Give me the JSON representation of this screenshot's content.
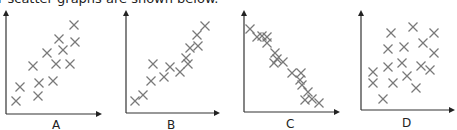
{
  "caption": "r scatter graphs are shown below.",
  "chart_data": [
    {
      "type": "scatter",
      "label": "A",
      "description": "moderate positive correlation",
      "axes": {
        "origin": [
          6,
          114
        ],
        "x_end": 102,
        "y_end": 10
      },
      "points": [
        [
          74,
          25
        ],
        [
          59,
          39
        ],
        [
          75,
          42
        ],
        [
          63,
          50
        ],
        [
          47,
          53
        ],
        [
          33,
          66
        ],
        [
          56,
          64
        ],
        [
          70,
          64
        ],
        [
          20,
          87
        ],
        [
          39,
          83
        ],
        [
          53,
          81
        ],
        [
          38,
          96
        ],
        [
          16,
          101
        ]
      ],
      "label_pos": [
        52,
        118
      ]
    },
    {
      "type": "scatter",
      "label": "B",
      "description": "strong positive correlation",
      "axes": {
        "origin": [
          126,
          113
        ],
        "x_end": 220,
        "y_end": 10
      },
      "points": [
        [
          205,
          26
        ],
        [
          197,
          35
        ],
        [
          190,
          48
        ],
        [
          198,
          46
        ],
        [
          186,
          58
        ],
        [
          188,
          64
        ],
        [
          180,
          72
        ],
        [
          170,
          67
        ],
        [
          164,
          77
        ],
        [
          153,
          64
        ],
        [
          151,
          81
        ],
        [
          143,
          95
        ],
        [
          135,
          101
        ]
      ],
      "label_pos": [
        167,
        118
      ]
    },
    {
      "type": "scatter",
      "label": "C",
      "description": "strong negative correlation",
      "axes": {
        "origin": [
          244,
          112
        ],
        "x_end": 340,
        "y_end": 10
      },
      "points": [
        [
          250,
          29
        ],
        [
          257,
          37
        ],
        [
          262,
          36
        ],
        [
          267,
          37
        ],
        [
          267,
          43
        ],
        [
          275,
          53
        ],
        [
          277,
          59
        ],
        [
          283,
          62
        ],
        [
          274,
          63
        ],
        [
          292,
          73
        ],
        [
          301,
          73
        ],
        [
          300,
          80
        ],
        [
          302,
          85
        ],
        [
          308,
          92
        ],
        [
          305,
          100
        ],
        [
          312,
          99
        ],
        [
          319,
          103
        ]
      ],
      "label_pos": [
        286,
        117
      ]
    },
    {
      "type": "scatter",
      "label": "D",
      "description": "no correlation",
      "axes": {
        "origin": [
          361,
          110
        ],
        "x_end": 455,
        "y_end": 10
      },
      "points": [
        [
          391,
          33
        ],
        [
          413,
          27
        ],
        [
          434,
          33
        ],
        [
          423,
          43
        ],
        [
          388,
          49
        ],
        [
          404,
          47
        ],
        [
          434,
          53
        ],
        [
          373,
          72
        ],
        [
          388,
          67
        ],
        [
          402,
          63
        ],
        [
          421,
          66
        ],
        [
          430,
          70
        ],
        [
          373,
          83
        ],
        [
          393,
          83
        ],
        [
          407,
          76
        ],
        [
          416,
          88
        ],
        [
          383,
          99
        ]
      ],
      "label_pos": [
        402,
        116
      ]
    }
  ]
}
